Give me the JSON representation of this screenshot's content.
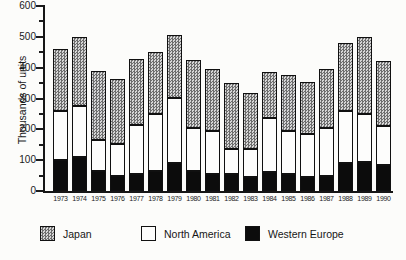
{
  "figure": {
    "background": "#fcfcfa",
    "accent_black": "#0c0c0c",
    "hatch_gray": "#6d6d6d"
  },
  "legend": [
    {
      "label": "Japan",
      "swatch": "hatched-gray"
    },
    {
      "label": "North America",
      "swatch": "white"
    },
    {
      "label": "Western Europe",
      "swatch": "black"
    }
  ],
  "chart_data": {
    "type": "bar",
    "stacked": true,
    "title": "",
    "xlabel": "",
    "ylabel": "Thousands of units",
    "ylim": [
      0,
      600
    ],
    "y_major_step": 100,
    "y_minor_step": 50,
    "y_tick_labels": [
      "0",
      "100",
      "200",
      "300",
      "400",
      "500",
      "600"
    ],
    "grid": false,
    "legend_position": "bottom",
    "categories": [
      "1973",
      "1974",
      "1975",
      "1976",
      "1977",
      "1978",
      "1979",
      "1980",
      "1981",
      "1982",
      "1983",
      "1984",
      "1985",
      "1986",
      "1987",
      "1988",
      "1989",
      "1990"
    ],
    "series": [
      {
        "name": "Western Europe",
        "fill": "black",
        "values": [
          100,
          110,
          65,
          50,
          55,
          65,
          90,
          65,
          55,
          55,
          45,
          60,
          55,
          45,
          50,
          90,
          95,
          85
        ]
      },
      {
        "name": "North America",
        "fill": "white",
        "values": [
          160,
          165,
          100,
          105,
          160,
          185,
          210,
          140,
          140,
          80,
          90,
          175,
          140,
          140,
          155,
          170,
          155,
          125
        ]
      },
      {
        "name": "Japan",
        "fill": "hatched-gray",
        "values": [
          200,
          225,
          225,
          210,
          215,
          200,
          205,
          220,
          200,
          215,
          180,
          150,
          180,
          170,
          190,
          220,
          250,
          210
        ]
      }
    ],
    "totals": [
      460,
      500,
      390,
      365,
      430,
      450,
      505,
      425,
      395,
      350,
      315,
      385,
      375,
      355,
      395,
      480,
      500,
      420
    ]
  }
}
